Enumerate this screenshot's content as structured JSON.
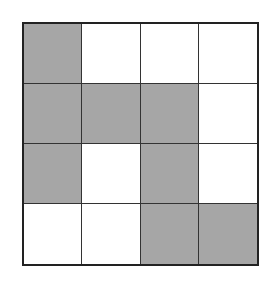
{
  "diagram": {
    "type": "grid",
    "rows": 4,
    "cols": 4,
    "fill_color": "#a6a6a6",
    "empty_color": "#ffffff",
    "line_color": "#222222",
    "cells": [
      [
        1,
        0,
        0,
        0
      ],
      [
        1,
        1,
        1,
        0
      ],
      [
        1,
        0,
        1,
        0
      ],
      [
        0,
        0,
        1,
        1
      ]
    ]
  }
}
